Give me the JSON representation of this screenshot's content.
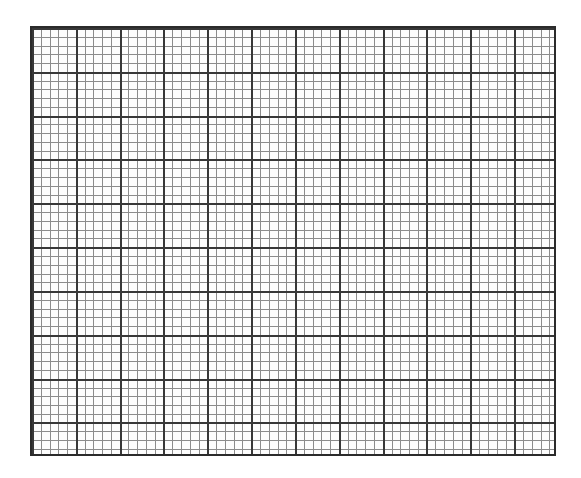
{
  "document": {
    "type": "graph-paper",
    "title": "Graph Paper Grid Sheet",
    "page_background_color": "#ffffff",
    "page_width_px": 581,
    "page_height_px": 478
  },
  "grid": {
    "name": "graph-paper-grid",
    "left_px": 30,
    "top_px": 26,
    "width_px": 526,
    "height_px": 430,
    "paper_color": "#fdfdfd",
    "border_color": "#2b2b2b",
    "border_width_px": 2,
    "minor": {
      "label": "minor gridline",
      "cell_size_px": 8.77,
      "color": "#8c8c8c",
      "line_width_px": 1,
      "columns": 60,
      "rows": 50
    },
    "major": {
      "label": "major gridline",
      "cell_size_px": 43.83,
      "color": "#383838",
      "line_width_px": 2,
      "minor_cells_per_major": 5,
      "columns": 12,
      "rows": 10
    }
  },
  "chart_data": {
    "type": "table",
    "xlabel": "",
    "ylabel": "",
    "grid": true,
    "legend": "none",
    "categories": [],
    "values": []
  }
}
